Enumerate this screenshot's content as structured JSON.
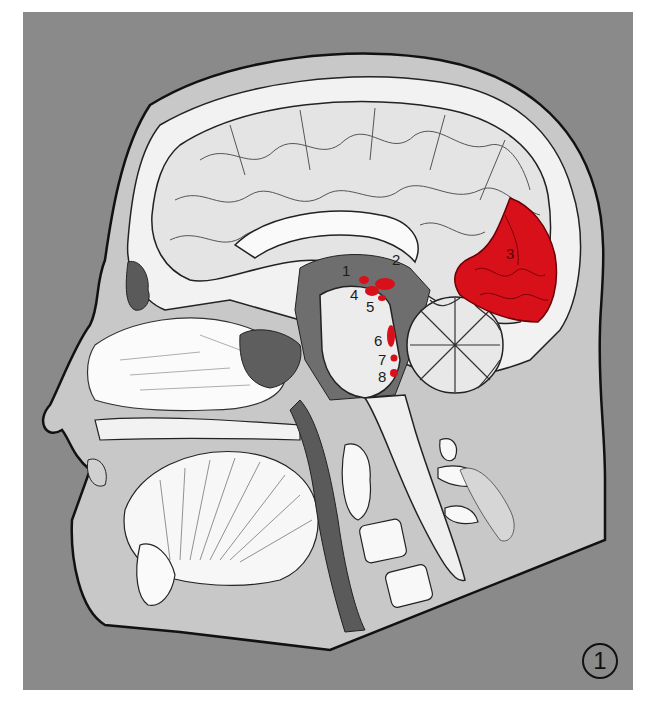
{
  "figure": {
    "figure_number": "1",
    "background_color": "#8a8a8a",
    "highlight_color": "#d8101a",
    "labels": [
      {
        "id": "1",
        "text": "1",
        "x": 342,
        "y": 263
      },
      {
        "id": "2",
        "text": "2",
        "x": 392,
        "y": 252
      },
      {
        "id": "3",
        "text": "3",
        "x": 506,
        "y": 246
      },
      {
        "id": "4",
        "text": "4",
        "x": 350,
        "y": 287
      },
      {
        "id": "5",
        "text": "5",
        "x": 366,
        "y": 299
      },
      {
        "id": "6",
        "text": "6",
        "x": 374,
        "y": 333
      },
      {
        "id": "7",
        "text": "7",
        "x": 378,
        "y": 352
      },
      {
        "id": "8",
        "text": "8",
        "x": 378,
        "y": 369
      }
    ],
    "highlighted_regions": [
      {
        "name": "occipital-cortex",
        "label": "3"
      },
      {
        "name": "nucleus-1",
        "label": "1"
      },
      {
        "name": "nucleus-4",
        "label": "4"
      },
      {
        "name": "nucleus-5",
        "label": "5"
      },
      {
        "name": "nucleus-6",
        "label": "6"
      },
      {
        "name": "nucleus-7",
        "label": "7"
      },
      {
        "name": "nucleus-8",
        "label": "8"
      }
    ]
  }
}
